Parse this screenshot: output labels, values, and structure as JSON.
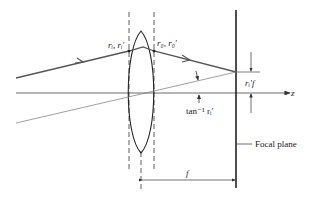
{
  "diagram": {
    "labels": {
      "input_ray": "r",
      "input_ray_sub": "i",
      "input_ray_prime": "r",
      "input_ray_prime_sub": "i",
      "input_label": "rᵢ, rᵢ′",
      "output_label": "r₀, r₀′",
      "angle_label": "tan⁻¹ rᵢ′",
      "height_label": "rᵢ′f",
      "axis_label": "z",
      "focal_plane_label": "Focal plane",
      "focal_length_label": "f"
    },
    "colors": {
      "ray": "#555555",
      "thin_ray": "#777777",
      "lens": "#222222",
      "axis": "#444444",
      "focal_plane": "#222222"
    }
  }
}
